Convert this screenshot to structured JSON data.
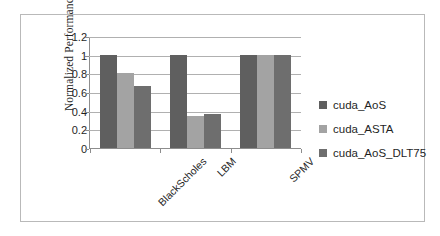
{
  "chart_data": {
    "type": "bar",
    "title": "",
    "xlabel": "",
    "ylabel": "Normalized Performance",
    "categories": [
      "BlackScholes",
      "LBM",
      "SPMV"
    ],
    "series": [
      {
        "name": "cuda_AoS",
        "color": "#5f5f5f",
        "values": [
          1,
          1,
          1
        ]
      },
      {
        "name": "cuda_ASTA",
        "color": "#a3a3a3",
        "values": [
          0.8,
          0.34,
          1
        ]
      },
      {
        "name": "cuda_AoS_DLT75",
        "color": "#6e6e6e",
        "values": [
          0.665,
          0.36,
          1
        ]
      }
    ],
    "ylim": [
      0,
      1.2
    ],
    "yticks": [
      "0",
      "0.2",
      "0.4",
      "0.6",
      "0.8",
      "1",
      "1.2"
    ],
    "ytick_values": [
      0,
      0.2,
      0.4,
      0.6,
      0.8,
      1,
      1.2
    ],
    "grid": true,
    "legend_position": "right",
    "axis_color": "#8d8d8d",
    "gridline_color": "#b0b0b0",
    "frame_color": "#b9b9b9",
    "background": "#ffffff"
  },
  "legend": {
    "items": [
      {
        "label": "cuda_AoS"
      },
      {
        "label": "cuda_ASTA"
      },
      {
        "label": "cuda_AoS_DLT75"
      }
    ]
  }
}
